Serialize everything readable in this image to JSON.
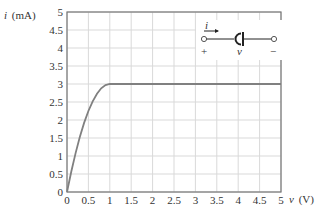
{
  "chart_data": {
    "type": "line",
    "title": "",
    "xlabel_var": "v",
    "xlabel_unit": "(V)",
    "ylabel_var": "i",
    "ylabel_unit": "(mA)",
    "xlim": [
      0,
      5
    ],
    "ylim": [
      0,
      5
    ],
    "grid": true,
    "xticks": [
      "0",
      "0.5",
      "1",
      "1.5",
      "2",
      "2.5",
      "3",
      "3.5",
      "4",
      "4.5",
      "5"
    ],
    "yticks": [
      "0",
      "0.5",
      "1",
      "1.5",
      "2",
      "2.5",
      "3",
      "3.5",
      "4",
      "4.5",
      "5"
    ],
    "series": [
      {
        "name": "i(v)",
        "color": "#808080",
        "x": [
          0,
          0.1,
          0.2,
          0.3,
          0.4,
          0.5,
          0.6,
          0.7,
          0.8,
          0.9,
          1.0,
          1.5,
          2,
          2.5,
          3,
          3.5,
          4,
          4.5,
          5
        ],
        "y": [
          0,
          0.57,
          1.08,
          1.53,
          1.92,
          2.25,
          2.52,
          2.73,
          2.88,
          2.97,
          3,
          3,
          3,
          3,
          3,
          3,
          3,
          3,
          3
        ]
      }
    ],
    "inset": {
      "description": "circuit element symbol with current arrow and voltage polarity",
      "current_label": "i",
      "voltage_label": "v",
      "plus_label": "+",
      "minus_label": "−"
    }
  },
  "colors": {
    "grid": "#d9d9d9",
    "axis": "#777777",
    "curve": "#808080",
    "text": "#333333"
  }
}
